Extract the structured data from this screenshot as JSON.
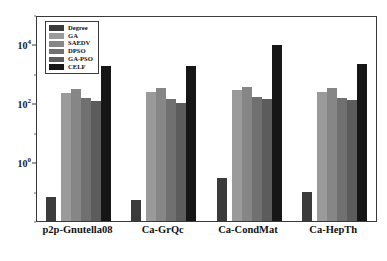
{
  "chart_data": {
    "type": "bar",
    "title": "",
    "xlabel": "",
    "ylabel": "",
    "yscale": "log",
    "ylim": [
      0.01,
      100000
    ],
    "grid": false,
    "legend_position": "upper-left",
    "categories": [
      "p2p-Gnutella08",
      "Ca-GrQc",
      "Ca-CondMat",
      "Ca-HepTh"
    ],
    "ytick_labels": [
      "10^0",
      "10^2",
      "10^4"
    ],
    "yticks": [
      1,
      100,
      10000
    ],
    "series": [
      {
        "name": "Degree",
        "color": "#3b3b3b",
        "values": [
          0.065,
          0.05,
          0.3,
          0.1
        ]
      },
      {
        "name": "GA",
        "color": "#9a9a9a",
        "values": [
          230,
          240,
          280,
          240
        ]
      },
      {
        "name": "SAEDV",
        "color": "#868686",
        "values": [
          310,
          330,
          360,
          320
        ]
      },
      {
        "name": "DPSO",
        "color": "#707070",
        "values": [
          150,
          140,
          160,
          150
        ]
      },
      {
        "name": "GA-PSO",
        "color": "#5c5c5c",
        "values": [
          120,
          105,
          145,
          130
        ]
      },
      {
        "name": "CELF",
        "color": "#161616",
        "values": [
          1800,
          1900,
          9500,
          2200
        ]
      }
    ]
  },
  "legend": {
    "items": [
      {
        "label": "Degree"
      },
      {
        "label": "GA"
      },
      {
        "label": "SAEDV"
      },
      {
        "label": "DPSO"
      },
      {
        "label": "GA-PSO"
      },
      {
        "label": "CELF"
      }
    ]
  },
  "axis": {
    "y_tick_1": "10",
    "y_tick_1_exp": "0",
    "y_tick_2": "10",
    "y_tick_2_exp": "2",
    "y_tick_3": "10",
    "y_tick_3_exp": "4"
  }
}
